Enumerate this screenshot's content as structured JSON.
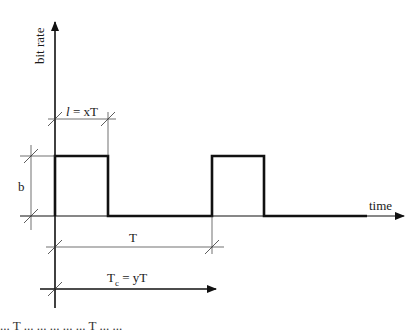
{
  "diagram": {
    "axes": {
      "y_label": "bit rate",
      "x_label": "time"
    },
    "dimensions": {
      "pulse_width": {
        "symbol": "l",
        "label_rest": " = xT"
      },
      "amplitude": {
        "label": "b"
      },
      "period": {
        "label": "T"
      },
      "Tc": {
        "label_main": "T",
        "label_sub": "c",
        "label_rest": " = yT"
      }
    },
    "pulses": [
      {
        "start_x": 55,
        "end_x": 108
      },
      {
        "start_x": 212,
        "end_x": 264
      }
    ],
    "colors": {
      "stroke": "#111111",
      "thin_line": "#333333",
      "background": "#ffffff"
    }
  },
  "caption": {
    "text": "... T ... ... ... ... ... T ... ..."
  }
}
